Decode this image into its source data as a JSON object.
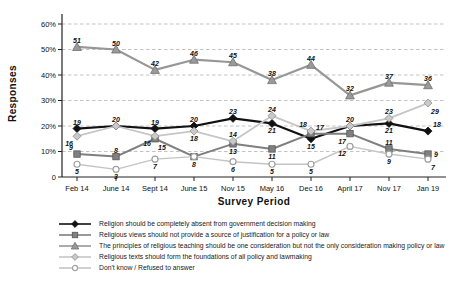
{
  "chart_data": {
    "type": "line",
    "title": "",
    "xlabel": "Survey Period",
    "ylabel": "Responses",
    "ylim": [
      0,
      60
    ],
    "ytick_values": [
      0,
      10,
      20,
      30,
      40,
      50,
      60
    ],
    "ytick_labels": [
      "0",
      "10%",
      "20%",
      "30%",
      "40%",
      "50%",
      "60%"
    ],
    "categories": [
      "Feb 14",
      "June 14",
      "Sept 14",
      "June 15",
      "Nov 15",
      "May 16",
      "Dec 16",
      "April 17",
      "Nov 17",
      "Jan 19"
    ],
    "grid": "horizontal-dashed",
    "legend_position": "bottom-left",
    "series": [
      {
        "name": "Religion should be completely absent from government decision making",
        "marker": "diamond",
        "color": "#111111",
        "fill": "#111111",
        "edge": "#111111",
        "line_width": 2.2,
        "values": [
          19,
          20,
          19,
          20,
          23,
          21,
          15,
          20,
          21,
          18
        ],
        "label_pos": [
          "a",
          "a",
          "a",
          "a",
          "a",
          "b",
          "b",
          "a",
          "b",
          "ar"
        ]
      },
      {
        "name": "Religious views should not provide a source of justification for a policy or law",
        "marker": "square",
        "color": "#7f7f7f",
        "fill": "#808080",
        "edge": "#565656",
        "line_width": 2.0,
        "values": [
          9,
          8,
          15,
          8,
          13,
          11,
          17,
          17,
          11,
          9
        ],
        "label_pos": [
          "al",
          "a",
          "br",
          "n",
          "b",
          "b",
          "ar",
          "bl",
          "a",
          "r"
        ]
      },
      {
        "name": "The principles of religious teaching should be one consideration but not the only consideration making policy or law",
        "marker": "triangle",
        "color": "#979797",
        "fill": "#9a9a9a",
        "edge": "#6f6f6f",
        "line_width": 2.2,
        "values": [
          51,
          50,
          42,
          46,
          45,
          38,
          44,
          32,
          37,
          36
        ],
        "label_pos": [
          "a",
          "a",
          "a",
          "a",
          "a",
          "a",
          "a",
          "a",
          "a",
          "a"
        ]
      },
      {
        "name": "Religious texts should form the foundations of all policy and lawmaking",
        "marker": "diamond",
        "color": "#c6c6c6",
        "fill": "#c9c9c9",
        "edge": "#8f8f8f",
        "line_width": 1.8,
        "values": [
          16,
          20,
          16,
          18,
          14,
          24,
          18,
          20,
          23,
          29
        ],
        "label_pos": [
          "bl",
          "n",
          "bl",
          "b",
          "a",
          "a",
          "al",
          "n",
          "a",
          "br"
        ]
      },
      {
        "name": "Don't know / Refused to answer",
        "marker": "circle",
        "color": "#c4c4c4",
        "fill": "#ffffff",
        "edge": "#a0a0a0",
        "line_width": 1.4,
        "values": [
          5,
          3,
          7,
          8,
          6,
          5,
          5,
          12,
          9,
          7
        ],
        "label_pos": [
          "b",
          "b",
          "b",
          "b",
          "b",
          "b",
          "b",
          "bl",
          "b",
          "br"
        ]
      }
    ]
  }
}
